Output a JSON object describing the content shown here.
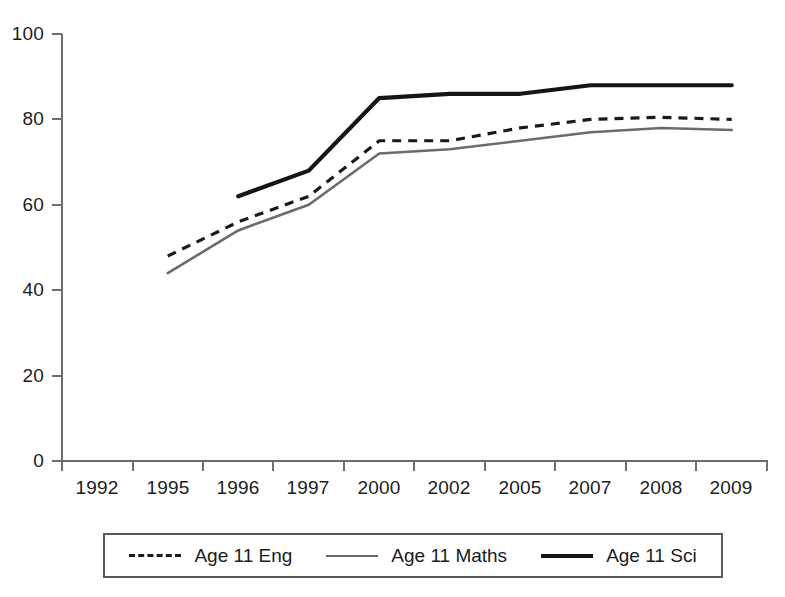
{
  "chart_data": {
    "type": "line",
    "title": "",
    "xlabel": "",
    "ylabel": "",
    "categories": [
      "1992",
      "1995",
      "1996",
      "1997",
      "2000",
      "2002",
      "2005",
      "2007",
      "2008",
      "2009"
    ],
    "ylim": [
      0,
      100
    ],
    "yticks": [
      0,
      20,
      40,
      60,
      80,
      100
    ],
    "grid": false,
    "legend_position": "bottom",
    "series": [
      {
        "name": "Age 11 Eng",
        "style": "dashed",
        "color": "#1a1a1a",
        "values": [
          null,
          48,
          56,
          62,
          75,
          75,
          78,
          80,
          80.5,
          80
        ]
      },
      {
        "name": "Age 11 Maths",
        "style": "solid-thin",
        "color": "#6b6b6b",
        "values": [
          null,
          44,
          54,
          60,
          72,
          73,
          75,
          77,
          78,
          77.5
        ]
      },
      {
        "name": "Age 11 Sci",
        "style": "solid-thick",
        "color": "#151515",
        "values": [
          null,
          null,
          62,
          68,
          85,
          86,
          86,
          88,
          88,
          88
        ]
      }
    ]
  },
  "axis": {
    "y_tick_labels": [
      "100",
      "80",
      "60",
      "40",
      "20",
      "0"
    ],
    "x_tick_labels": [
      "1992",
      "1995",
      "1996",
      "1997",
      "2000",
      "2002",
      "2005",
      "2007",
      "2008",
      "2009"
    ]
  },
  "legend": {
    "entries": [
      {
        "label": "Age 11 Eng",
        "swatch": "dashed-line-swatch"
      },
      {
        "label": "Age 11 Maths",
        "swatch": "thin-solid-line-swatch"
      },
      {
        "label": "Age 11 Sci",
        "swatch": "thick-solid-line-swatch"
      }
    ]
  }
}
